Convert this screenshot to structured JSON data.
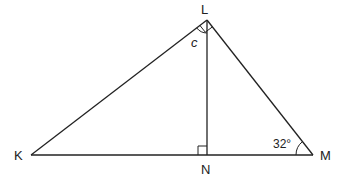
{
  "diagram": {
    "type": "right-triangle-with-altitude",
    "stroke_color": "#222222",
    "vertices": {
      "K": {
        "label": "K",
        "x": 31,
        "y": 155
      },
      "L": {
        "label": "L",
        "x": 207,
        "y": 20
      },
      "M": {
        "label": "M",
        "x": 313,
        "y": 155
      },
      "N": {
        "label": "N",
        "x": 207,
        "y": 155
      }
    },
    "segments": [
      "KL",
      "LM",
      "KM",
      "LN"
    ],
    "right_angles": [
      "KLM",
      "LNK"
    ],
    "angle_labels": {
      "c": {
        "text": "c",
        "at": "L",
        "between": "LK,LN"
      },
      "m": {
        "text": "32°",
        "at": "M"
      }
    }
  }
}
